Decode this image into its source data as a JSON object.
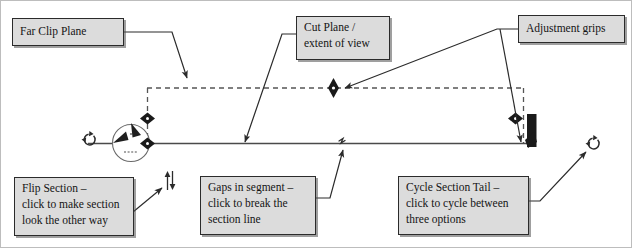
{
  "diagram": {
    "colors": {
      "callout_fill": "#dcdcdc",
      "callout_border": "#2b2b2b",
      "line": "#4a4a4a",
      "grip": "#1a1a1a",
      "page_background": "#ffffff"
    }
  },
  "callouts": {
    "far_clip_plane": {
      "text": "Far Clip Plane"
    },
    "cut_plane": {
      "text": "Cut Plane /\nextent of view"
    },
    "adjustment_grips": {
      "text": "Adjustment grips"
    },
    "flip_section": {
      "text": "Flip Section –\nclick to make section\nlook the other way"
    },
    "gaps_in_segment": {
      "text": "Gaps in segment –\nclick to break the\nsection line"
    },
    "cycle_section_tail": {
      "text": "Cycle Section Tail –\nclick to cycle between\nthree options"
    }
  },
  "icons": {
    "rotate_left": "rotate-icon",
    "rotate_right": "rotate-icon",
    "flip": "flip-vertical-arrows-icon",
    "gap_break": "gap-break-icon",
    "section_head": "section-head-icon",
    "section_tail": "section-tail-icon",
    "grip_horizontal": "horizontal-diamond-grip-icon",
    "grip_vertical": "vertical-diamond-grip-icon"
  },
  "geometry": {
    "far_clip_dashed_line_y": 88,
    "section_line_y": 143,
    "dashed_left_x": 147,
    "dashed_right_x": 523
  }
}
